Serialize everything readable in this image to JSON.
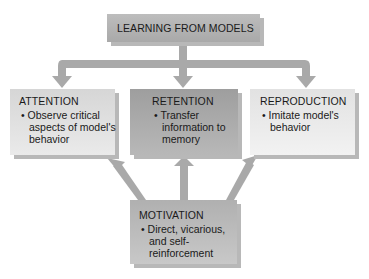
{
  "diagram": {
    "top": {
      "title": "LEARNING FROM MODELS"
    },
    "boxes": [
      {
        "title": "ATTENTION",
        "bullet": "• Observe critical aspects of model's behavior"
      },
      {
        "title": "RETENTION",
        "bullet": "• Transfer information to memory"
      },
      {
        "title": "REPRODUCTION",
        "bullet": "• Imitate model's behavior"
      }
    ],
    "bottom": {
      "title": "MOTIVATION",
      "bullet": "• Direct, vicarious, and self-reinforcement"
    }
  },
  "colors": {
    "arrow": "#a9a9a9",
    "top_box": "#b4b4b4",
    "attention": "#dcdcdc",
    "retention": "#a8a8a8",
    "reproduction": "#ebebeb",
    "motivation": "#bcbcbc"
  }
}
